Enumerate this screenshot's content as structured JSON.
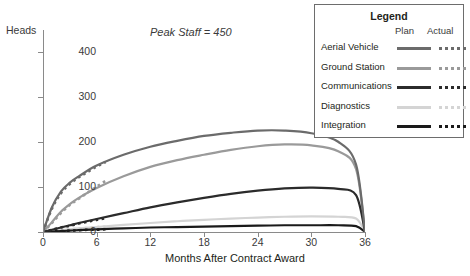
{
  "chart_data": {
    "type": "line",
    "title": "",
    "annotation": "Peak Staff = 450",
    "xlabel": "Months After Contract Award",
    "ylabel": "Heads",
    "xlim": [
      0,
      36
    ],
    "ylim": [
      0,
      450
    ],
    "xticks": [
      0,
      6,
      12,
      18,
      24,
      30,
      36
    ],
    "yticks": [
      0,
      100,
      200,
      300,
      400
    ],
    "grid": false,
    "legend_position": "top-right",
    "x": [
      0,
      1,
      2,
      3,
      4,
      6,
      9,
      12,
      15,
      18,
      21,
      24,
      27,
      30,
      33,
      35,
      36
    ],
    "series": [
      {
        "name": "Aerial Vehicle",
        "color": "#6b6b6b",
        "plan": [
          0,
          55,
          90,
          110,
          124,
          148,
          172,
          190,
          203,
          214,
          221,
          226,
          226,
          220,
          201,
          150,
          0
        ],
        "actual_x": [
          0,
          1,
          2,
          3,
          4,
          5,
          6,
          7
        ],
        "actual": [
          0,
          52,
          86,
          107,
          122,
          134,
          146,
          156
        ]
      },
      {
        "name": "Ground Station",
        "color": "#9a9a9a",
        "plan": [
          0,
          22,
          45,
          62,
          76,
          98,
          124,
          145,
          160,
          172,
          183,
          191,
          195,
          193,
          180,
          140,
          0
        ],
        "actual_x": [
          0,
          1,
          2,
          3,
          4,
          5,
          6,
          7
        ],
        "actual": [
          0,
          20,
          42,
          60,
          74,
          88,
          101,
          114
        ]
      },
      {
        "name": "Communications",
        "color": "#2b2b2b",
        "plan": [
          0,
          5,
          10,
          15,
          20,
          29,
          42,
          55,
          66,
          76,
          85,
          92,
          97,
          99,
          96,
          82,
          0
        ],
        "actual_x": [
          0,
          1,
          2,
          3,
          4,
          5,
          6,
          7
        ],
        "actual": [
          0,
          5,
          10,
          14,
          19,
          23,
          27,
          31
        ]
      },
      {
        "name": "Diagnostics",
        "color": "#d4d4d4",
        "plan": [
          0,
          2,
          4,
          6,
          8,
          11,
          16,
          20,
          24,
          27,
          30,
          32,
          34,
          35,
          34,
          30,
          0
        ],
        "actual_x": [
          0,
          1,
          2,
          3,
          4,
          5,
          6,
          7
        ],
        "actual": [
          0,
          2,
          4,
          6,
          8,
          9,
          11,
          12
        ]
      },
      {
        "name": "Integration",
        "color": "#1a1a1a",
        "plan": [
          0,
          1,
          2,
          3,
          4,
          6,
          8,
          10,
          11,
          12,
          13,
          14,
          15,
          15,
          15,
          13,
          0
        ],
        "actual_x": [
          0,
          1,
          2,
          3,
          4,
          5,
          6,
          7
        ],
        "actual": [
          0,
          1,
          2,
          3,
          4,
          5,
          5,
          6
        ]
      }
    ]
  },
  "axes": {
    "y_title": "Heads",
    "x_title": "Months After Contract Award",
    "y_tick_labels": [
      "0",
      "100",
      "200",
      "300",
      "400"
    ],
    "x_tick_labels": [
      "0",
      "6",
      "12",
      "18",
      "24",
      "30",
      "36"
    ]
  },
  "legend": {
    "title": "Legend",
    "col_plan": "Plan",
    "col_actual": "Actual",
    "items": [
      {
        "label": "Aerial Vehicle",
        "color": "#6b6b6b"
      },
      {
        "label": "Ground Station",
        "color": "#9a9a9a"
      },
      {
        "label": "Communications",
        "color": "#2b2b2b"
      },
      {
        "label": "Diagnostics",
        "color": "#d4d4d4"
      },
      {
        "label": "Integration",
        "color": "#1a1a1a"
      }
    ]
  }
}
